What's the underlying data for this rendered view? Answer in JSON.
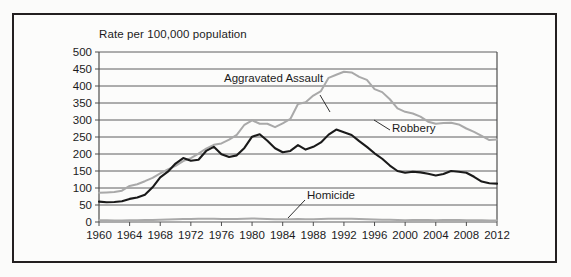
{
  "figure": {
    "background_color": "#fbfbfa",
    "frame_color": "#231f20",
    "plot_background": "#fcfcfb"
  },
  "labels": {
    "y_axis_title": "Rate per 100,000 population",
    "aggravated_assault": "Aggravated Assault",
    "robbery": "Robbery",
    "homicide": "Homicide"
  },
  "chart_data": {
    "type": "line",
    "title": "",
    "subtitle": "",
    "xlabel": "",
    "ylabel": "Rate per 100,000 population",
    "xlim": [
      1960,
      2012
    ],
    "ylim": [
      0,
      500
    ],
    "grid": true,
    "legend_position": "inline-annotations",
    "y_ticks": [
      0,
      50,
      100,
      150,
      200,
      250,
      300,
      350,
      400,
      450,
      500
    ],
    "x_ticks": [
      1960,
      1964,
      1968,
      1972,
      1976,
      1980,
      1984,
      1988,
      1992,
      1996,
      2000,
      2004,
      2008,
      2012
    ],
    "x": [
      1960,
      1961,
      1962,
      1963,
      1964,
      1965,
      1966,
      1967,
      1968,
      1969,
      1970,
      1971,
      1972,
      1973,
      1974,
      1975,
      1976,
      1977,
      1978,
      1979,
      1980,
      1981,
      1982,
      1983,
      1984,
      1985,
      1986,
      1987,
      1988,
      1989,
      1990,
      1991,
      1992,
      1993,
      1994,
      1995,
      1996,
      1997,
      1998,
      1999,
      2000,
      2001,
      2002,
      2003,
      2004,
      2005,
      2006,
      2007,
      2008,
      2009,
      2010,
      2011,
      2012
    ],
    "series": [
      {
        "name": "Aggravated Assault",
        "color": "#a9a9a9",
        "values": [
          86,
          87,
          88,
          92,
          106,
          111,
          120,
          130,
          143,
          155,
          165,
          179,
          188,
          201,
          216,
          227,
          231,
          242,
          256,
          286,
          299,
          289,
          289,
          279,
          290,
          303,
          347,
          352,
          372,
          385,
          424,
          433,
          442,
          440,
          427,
          418,
          391,
          382,
          361,
          334,
          324,
          319,
          310,
          295,
          289,
          291,
          292,
          287,
          275,
          265,
          253,
          241,
          243
        ]
      },
      {
        "name": "Robbery",
        "color": "#1a1a1a",
        "values": [
          60,
          58,
          59,
          61,
          68,
          72,
          80,
          102,
          131,
          148,
          172,
          188,
          180,
          183,
          209,
          221,
          199,
          191,
          196,
          218,
          251,
          258,
          239,
          217,
          205,
          209,
          226,
          213,
          221,
          234,
          257,
          272,
          264,
          256,
          238,
          221,
          202,
          186,
          166,
          150,
          145,
          148,
          146,
          142,
          137,
          141,
          150,
          148,
          145,
          133,
          119,
          114,
          113
        ]
      },
      {
        "name": "Homicide",
        "color": "#a9a9a9",
        "values": [
          5.1,
          4.8,
          4.6,
          4.6,
          4.9,
          5.1,
          5.6,
          6.2,
          6.9,
          7.3,
          7.9,
          8.6,
          9.0,
          9.4,
          9.8,
          9.6,
          8.8,
          8.8,
          9.0,
          9.7,
          10.2,
          9.8,
          9.1,
          8.3,
          7.9,
          8.0,
          8.6,
          8.3,
          8.4,
          8.7,
          9.4,
          9.8,
          9.3,
          9.5,
          9.0,
          8.2,
          7.4,
          6.8,
          6.3,
          5.7,
          5.5,
          5.6,
          5.6,
          5.7,
          5.5,
          5.6,
          5.8,
          5.7,
          5.4,
          5.0,
          4.8,
          4.7,
          4.7
        ]
      }
    ],
    "annotations": [
      {
        "text": "Aggravated Assault",
        "series": "Aggravated Assault"
      },
      {
        "text": "Robbery",
        "series": "Robbery"
      },
      {
        "text": "Homicide",
        "series": "Homicide"
      }
    ]
  }
}
